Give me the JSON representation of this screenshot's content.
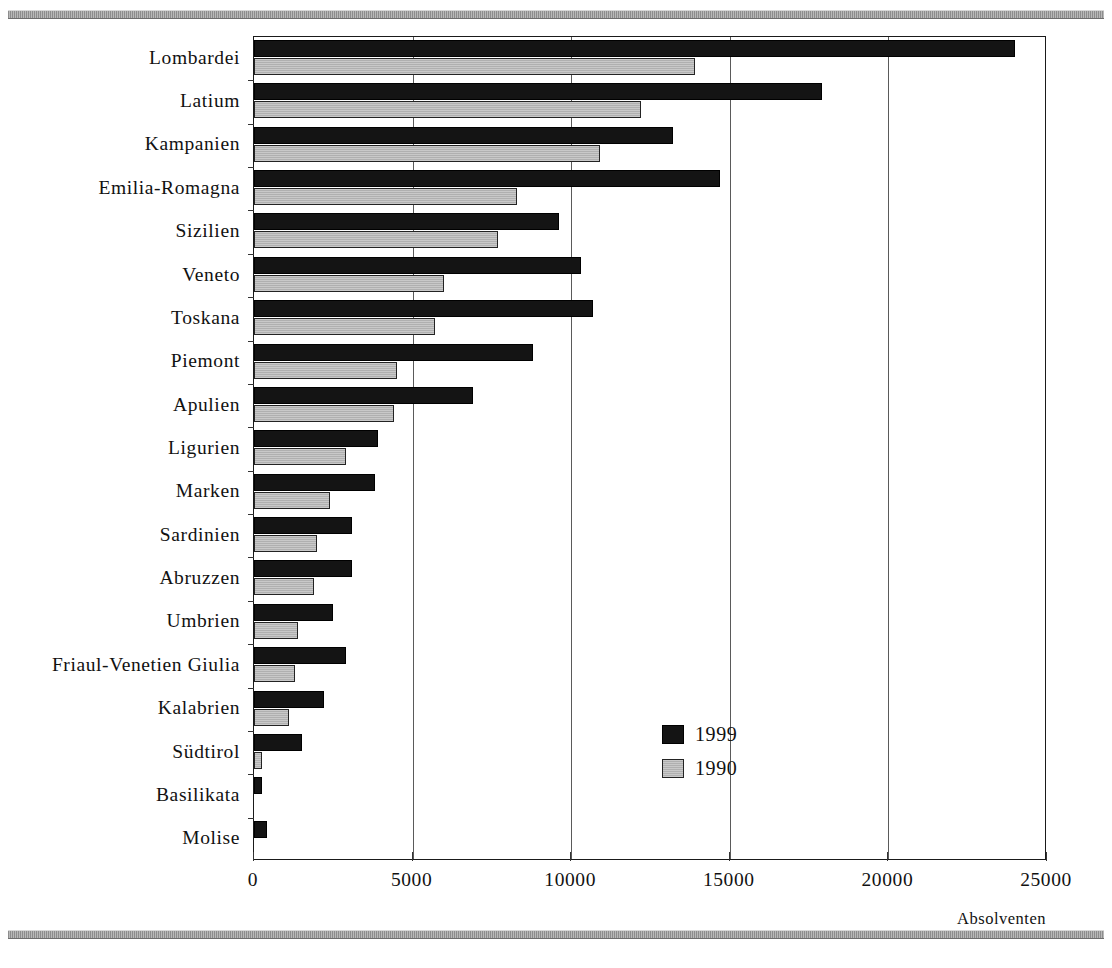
{
  "chart_data": {
    "type": "bar",
    "orientation": "horizontal",
    "title": "",
    "xlabel": "Absolventen",
    "ylabel": "",
    "xlim": [
      0,
      25000
    ],
    "xticks": [
      "0",
      "5000",
      "10000",
      "15000",
      "20000",
      "25000"
    ],
    "xtick_values": [
      0,
      5000,
      10000,
      15000,
      20000,
      25000
    ],
    "grid": true,
    "legend_position": "bottom-right",
    "categories": [
      "Lombardei",
      "Latium",
      "Kampanien",
      "Emilia-Romagna",
      "Sizilien",
      "Veneto",
      "Toskana",
      "Piemont",
      "Apulien",
      "Ligurien",
      "Marken",
      "Sardinien",
      "Abruzzen",
      "Umbrien",
      "Friaul-Venetien Giulia",
      "Kalabrien",
      "Südtirol",
      "Basilikata",
      "Molise"
    ],
    "series": [
      {
        "name": "1999",
        "color": "#141414",
        "values": [
          24000,
          17900,
          13200,
          14700,
          9600,
          10300,
          10700,
          8800,
          6900,
          3900,
          3800,
          3100,
          3100,
          2500,
          2900,
          2200,
          1500,
          250,
          420
        ]
      },
      {
        "name": "1990",
        "color": "#c9c9c9",
        "values": [
          13900,
          12200,
          10900,
          8300,
          7700,
          6000,
          5700,
          4500,
          4400,
          2900,
          2400,
          2000,
          1900,
          1400,
          1300,
          1100,
          250,
          0,
          0
        ]
      }
    ]
  },
  "legend": {
    "entries": [
      {
        "label": "1999",
        "swatch": "black-filled-square"
      },
      {
        "label": "1990",
        "swatch": "gray-hatched-square"
      }
    ]
  },
  "axis": {
    "x_title": "Absolventen"
  }
}
